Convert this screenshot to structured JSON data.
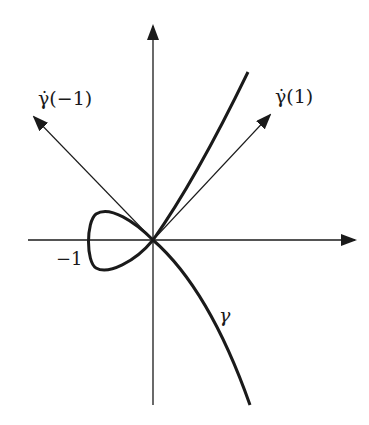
{
  "diagram": {
    "labels": {
      "gamma_dot_minus1": "γ̇(−1)",
      "gamma_dot_1": "γ̇(1)",
      "minus_one": "−1",
      "gamma": "γ"
    },
    "colors": {
      "ink": "#1a1a1a",
      "background": "#ffffff"
    }
  }
}
